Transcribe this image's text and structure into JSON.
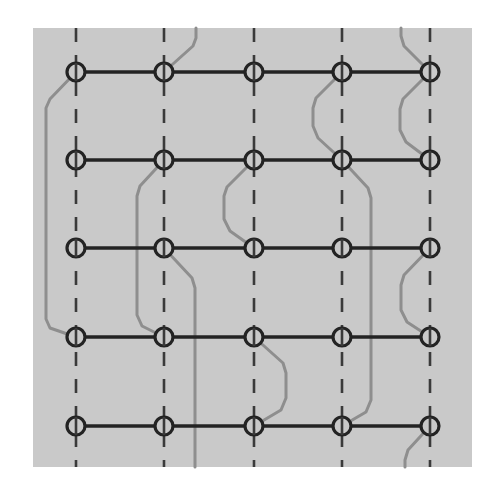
{
  "figure": {
    "kind": "grid-network-routing-diagram",
    "title": "",
    "panel": {
      "x": 33,
      "y": 28,
      "width": 439,
      "height": 439,
      "fill": "#c9c9c9"
    },
    "canvas": {
      "width": 496,
      "height": 492,
      "background": "#ffffff"
    }
  },
  "style": {
    "node_fill": "#c9c9c9",
    "node_stroke": "#232323",
    "node_radius": 9,
    "node_stroke_width": 3.2,
    "edge_color": "#232323",
    "edge_width": 3.4,
    "dashed_color": "#3a3a3a",
    "dashed_width": 2.6,
    "dash_pattern": "14 13",
    "route_color": "#8e8e8e",
    "route_width": 3.0
  },
  "grid": {
    "columns": [
      76,
      164,
      254,
      342,
      430
    ],
    "rows": [
      72,
      160,
      248,
      337,
      426
    ],
    "column_count": 5,
    "row_count": 5,
    "column_spacing": 88,
    "row_spacing": 88
  },
  "dashed_verticals": [
    {
      "name": "dashed-col-1",
      "x": 76,
      "y1": 28,
      "y2": 467
    },
    {
      "name": "dashed-col-2",
      "x": 164,
      "y1": 28,
      "y2": 467
    },
    {
      "name": "dashed-col-3",
      "x": 254,
      "y1": 28,
      "y2": 467
    },
    {
      "name": "dashed-col-4",
      "x": 342,
      "y1": 28,
      "y2": 467
    },
    {
      "name": "dashed-col-5",
      "x": 430,
      "y1": 28,
      "y2": 467
    }
  ],
  "horizontal_edges": [
    {
      "name": "edge-row-1",
      "y": 72,
      "x1": 76,
      "x2": 430
    },
    {
      "name": "edge-row-2",
      "y": 160,
      "x1": 76,
      "x2": 430
    },
    {
      "name": "edge-row-3",
      "y": 248,
      "x1": 76,
      "x2": 430
    },
    {
      "name": "edge-row-4",
      "y": 337,
      "x1": 76,
      "x2": 430
    },
    {
      "name": "edge-row-5",
      "y": 426,
      "x1": 76,
      "x2": 430
    }
  ],
  "nodes": [
    {
      "id": "n-r1c1",
      "row": 1,
      "col": 1,
      "x": 76,
      "y": 72
    },
    {
      "id": "n-r1c2",
      "row": 1,
      "col": 2,
      "x": 164,
      "y": 72
    },
    {
      "id": "n-r1c3",
      "row": 1,
      "col": 3,
      "x": 254,
      "y": 72
    },
    {
      "id": "n-r1c4",
      "row": 1,
      "col": 4,
      "x": 342,
      "y": 72
    },
    {
      "id": "n-r1c5",
      "row": 1,
      "col": 5,
      "x": 430,
      "y": 72
    },
    {
      "id": "n-r2c1",
      "row": 2,
      "col": 1,
      "x": 76,
      "y": 160
    },
    {
      "id": "n-r2c2",
      "row": 2,
      "col": 2,
      "x": 164,
      "y": 160
    },
    {
      "id": "n-r2c3",
      "row": 2,
      "col": 3,
      "x": 254,
      "y": 160
    },
    {
      "id": "n-r2c4",
      "row": 2,
      "col": 4,
      "x": 342,
      "y": 160
    },
    {
      "id": "n-r2c5",
      "row": 2,
      "col": 5,
      "x": 430,
      "y": 160
    },
    {
      "id": "n-r3c1",
      "row": 3,
      "col": 1,
      "x": 76,
      "y": 248
    },
    {
      "id": "n-r3c2",
      "row": 3,
      "col": 2,
      "x": 164,
      "y": 248
    },
    {
      "id": "n-r3c3",
      "row": 3,
      "col": 3,
      "x": 254,
      "y": 248
    },
    {
      "id": "n-r3c4",
      "row": 3,
      "col": 4,
      "x": 342,
      "y": 248
    },
    {
      "id": "n-r3c5",
      "row": 3,
      "col": 5,
      "x": 430,
      "y": 248
    },
    {
      "id": "n-r4c1",
      "row": 4,
      "col": 1,
      "x": 76,
      "y": 337
    },
    {
      "id": "n-r4c2",
      "row": 4,
      "col": 2,
      "x": 164,
      "y": 337
    },
    {
      "id": "n-r4c3",
      "row": 4,
      "col": 3,
      "x": 254,
      "y": 337
    },
    {
      "id": "n-r4c4",
      "row": 4,
      "col": 4,
      "x": 342,
      "y": 337
    },
    {
      "id": "n-r4c5",
      "row": 4,
      "col": 5,
      "x": 430,
      "y": 337
    },
    {
      "id": "n-r5c1",
      "row": 5,
      "col": 1,
      "x": 76,
      "y": 426
    },
    {
      "id": "n-r5c2",
      "row": 5,
      "col": 2,
      "x": 164,
      "y": 426
    },
    {
      "id": "n-r5c3",
      "row": 5,
      "col": 3,
      "x": 254,
      "y": 426
    },
    {
      "id": "n-r5c4",
      "row": 5,
      "col": 4,
      "x": 342,
      "y": 426
    },
    {
      "id": "n-r5c5",
      "row": 5,
      "col": 5,
      "x": 430,
      "y": 426
    }
  ],
  "routes": [
    {
      "id": "route-left-bypass",
      "label": "left detour from r1c1 to r4c1",
      "points": "76,72 50,99 46,108 46,319 50,328 76,337"
    },
    {
      "id": "route-c2-top-exit",
      "label": "r1c2 upward exit through top edge",
      "points": "164,72 193,46 196,38 196,28"
    },
    {
      "id": "route-c2-r2-detour",
      "label": "r2c2 detour down-left then to r4c2",
      "points": "164,160 140,186 137,196 137,315 142,326 164,337"
    },
    {
      "id": "route-c3-r2-detour",
      "label": "r2c3 detour down-left then to r3c3",
      "points": "254,160 227,187 224,196 224,219 230,231 254,248"
    },
    {
      "id": "route-c2-r3-down-exit",
      "label": "r3c2 diagonal to vertical trunk exiting bottom edge",
      "points": "164,248 192,278 195,288 195,467"
    },
    {
      "id": "route-c3-r4-bulge",
      "label": "r4c3 bulge right then back to r5c3",
      "points": "254,337 283,363 286,373 286,398 281,410 254,426"
    },
    {
      "id": "route-c4-r1-detour",
      "label": "r1c4 detour left then to r2c4",
      "points": "342,72 316,98 313,108 313,126 318,138 342,160"
    },
    {
      "id": "route-c4-r2-down-exit",
      "label": "r2c4 diagonal to vertical trunk exiting bottom edge",
      "points": "342,160 368,188 371,198 371,400 366,412 342,426"
    },
    {
      "id": "route-c5-r1-top-exit",
      "label": "r1c5 upward exit through top edge",
      "points": "430,72 404,46 401,36 401,28"
    },
    {
      "id": "route-c5-r1-to-r2",
      "label": "r1c5 detour left then to r2c5",
      "points": "430,72 403,99 400,109 400,130 406,142 430,160"
    },
    {
      "id": "route-c5-r3-to-r4",
      "label": "r3c5 detour left then to r4c5",
      "points": "430,248 404,275 401,285 401,310 407,322 430,337"
    },
    {
      "id": "route-c5-r5-bottom-exit",
      "label": "r5c5 downward exit through bottom edge",
      "points": "430,426 408,450 405,460 405,467"
    }
  ]
}
